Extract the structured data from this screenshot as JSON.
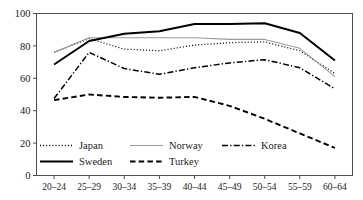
{
  "chart_data": {
    "type": "line",
    "title": "",
    "xlabel": "",
    "ylabel": "",
    "categories": [
      "20–24",
      "25–29",
      "30–34",
      "35–39",
      "40–44",
      "45–49",
      "50–54",
      "55–59",
      "60–64"
    ],
    "ylim": [
      0,
      100
    ],
    "yticks": [
      0,
      20,
      40,
      60,
      80,
      100
    ],
    "ytick_labels": [
      "0",
      "20",
      "40",
      "60",
      "80",
      "100"
    ],
    "grid": false,
    "legend_position": "inside-lower-left",
    "series": [
      {
        "name": "Japan",
        "style": "dotted",
        "color": "#000000",
        "width": 1.3,
        "values": [
          76,
          84.5,
          78,
          77,
          80.5,
          82,
          82.5,
          77,
          63
        ]
      },
      {
        "name": "Norway",
        "style": "solid-thin",
        "color": "#9a9a9a",
        "width": 1.1,
        "values": [
          76,
          85,
          85,
          85,
          85,
          84,
          84,
          78.5,
          61
        ]
      },
      {
        "name": "Korea",
        "style": "dashdot",
        "color": "#000000",
        "width": 1.5,
        "values": [
          47.5,
          76,
          66,
          62.5,
          66.5,
          69.5,
          71.5,
          66.5,
          53.5
        ]
      },
      {
        "name": "Sweden",
        "style": "solid-thick",
        "color": "#000000",
        "width": 2.0,
        "values": [
          68.5,
          83,
          87.5,
          89,
          93.5,
          93.5,
          94,
          88,
          71
        ]
      },
      {
        "name": "Turkey",
        "style": "dashed",
        "color": "#000000",
        "width": 1.9,
        "values": [
          46.5,
          50,
          48.5,
          48,
          48.5,
          43,
          35,
          26,
          17
        ]
      }
    ]
  },
  "legend": {
    "entries": [
      {
        "label": "Japan"
      },
      {
        "label": "Norway"
      },
      {
        "label": "Korea"
      },
      {
        "label": "Sweden"
      },
      {
        "label": "Turkey"
      }
    ]
  },
  "axis": {
    "frame_color": "#4d4d4d"
  }
}
